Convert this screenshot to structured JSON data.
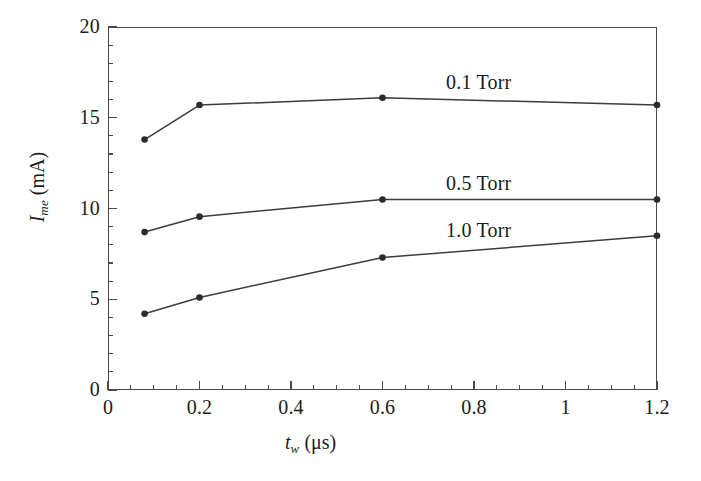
{
  "chart_data": {
    "type": "line",
    "title": "",
    "subtitle": "",
    "xlabel": "t_w (μs)",
    "ylabel": "I_me (mA)",
    "xlim": [
      0,
      1.2
    ],
    "ylim": [
      0,
      20
    ],
    "grid": false,
    "legend_position": "inline-annotations",
    "x_ticks": [
      {
        "value": 0,
        "label": "0"
      },
      {
        "value": 0.2,
        "label": "0.2"
      },
      {
        "value": 0.4,
        "label": "0.4"
      },
      {
        "value": 0.6,
        "label": "0.6"
      },
      {
        "value": 0.8,
        "label": "0.8"
      },
      {
        "value": 1.0,
        "label": "1"
      },
      {
        "value": 1.2,
        "label": "1.2"
      }
    ],
    "x_minor_step": 0.05,
    "y_ticks": [
      {
        "value": 0,
        "label": "0"
      },
      {
        "value": 5,
        "label": "5"
      },
      {
        "value": 10,
        "label": "10"
      },
      {
        "value": 15,
        "label": "15"
      },
      {
        "value": 20,
        "label": "20"
      }
    ],
    "y_minor_step": 1,
    "marker": "filled-circle",
    "line_color": "#3c3c3c",
    "marker_color": "#2b2b2b",
    "series": [
      {
        "name": "0.1 Torr",
        "x": [
          0.08,
          0.2,
          0.6,
          1.2
        ],
        "values": [
          13.8,
          15.7,
          16.1,
          15.7
        ]
      },
      {
        "name": "0.5 Torr",
        "x": [
          0.08,
          0.2,
          0.6,
          1.2
        ],
        "values": [
          8.7,
          9.55,
          10.5,
          10.5
        ]
      },
      {
        "name": "1.0 Torr",
        "x": [
          0.08,
          0.2,
          0.6,
          1.2
        ],
        "values": [
          4.2,
          5.1,
          7.3,
          8.5
        ]
      }
    ]
  },
  "axis": {
    "x_title_var": "t",
    "x_title_sub": "w",
    "x_title_unit": "(μs)",
    "y_title_var": "I",
    "y_title_sub": "me",
    "y_title_unit": "(mA)"
  },
  "annotations": [
    {
      "label": "0.1 Torr"
    },
    {
      "label": "0.5 Torr"
    },
    {
      "label": "1.0 Torr"
    }
  ],
  "colors": {
    "axis": "#4a4a4a",
    "line": "#3c3c3c",
    "marker": "#2b2b2b",
    "text": "#1b1b1b",
    "background": "#ffffff"
  }
}
